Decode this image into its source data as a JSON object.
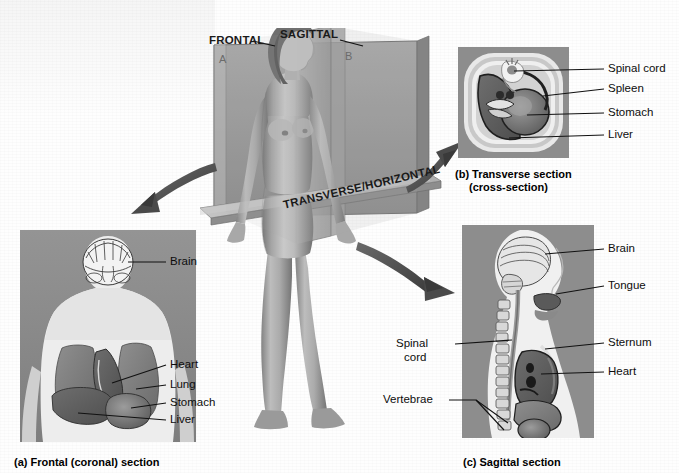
{
  "figure": {
    "background_color": "#ffffff"
  },
  "central_diagram": {
    "name": "body-planes-model",
    "plane_labels": [
      {
        "id": "frontal",
        "text": "FRONTAL"
      },
      {
        "id": "sagittal",
        "text": "SAGITTAL"
      },
      {
        "id": "transverse",
        "text": "TRANSVERSE/HORIZONTAL"
      }
    ],
    "quadrant_markers": [
      {
        "id": "a",
        "text": "A"
      },
      {
        "id": "b",
        "text": "B"
      }
    ],
    "plane_color": "#9a9a9a",
    "figure_description": "standing female body model"
  },
  "panels": [
    {
      "id": "a",
      "caption": "(a) Frontal (coronal) section",
      "caption_lines": [
        "(a) Frontal (coronal) section"
      ],
      "labels": [
        {
          "text": "Brain"
        },
        {
          "text": "Heart"
        },
        {
          "text": "Lung"
        },
        {
          "text": "Stomach"
        },
        {
          "text": "Liver"
        }
      ]
    },
    {
      "id": "b",
      "caption": "(b) Transverse section (cross-section)",
      "caption_lines": [
        "(b) Transverse section",
        "(cross-section)"
      ],
      "labels": [
        {
          "text": "Spinal cord"
        },
        {
          "text": "Spleen"
        },
        {
          "text": "Stomach"
        },
        {
          "text": "Liver"
        }
      ]
    },
    {
      "id": "c",
      "caption": "(c) Sagittal section",
      "caption_lines": [
        "(c) Sagittal section"
      ],
      "labels": [
        {
          "text": "Brain"
        },
        {
          "text": "Tongue"
        },
        {
          "text": "Sternum"
        },
        {
          "text": "Heart"
        },
        {
          "text": "Spinal"
        },
        {
          "text": "cord"
        },
        {
          "text": "Vertebrae"
        }
      ]
    }
  ],
  "arrows": [
    {
      "id": "to-frontal",
      "direction": "down-left",
      "target_panel": "a"
    },
    {
      "id": "to-transverse",
      "direction": "up-right",
      "target_panel": "b"
    },
    {
      "id": "to-sagittal",
      "direction": "down-right",
      "target_panel": "c"
    }
  ],
  "colors": {
    "panel_background": "#8e8e8e",
    "leader_line": "#111111",
    "arrow_fill": "#4f4f4f",
    "text": "#111111"
  }
}
